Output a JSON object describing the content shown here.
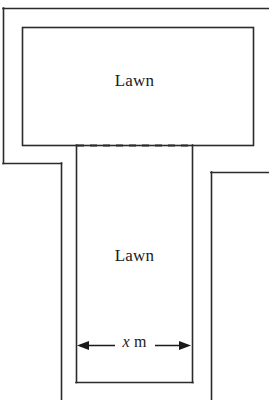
{
  "figure": {
    "background_color": "#ffffff",
    "line_color": "#2b2b2b",
    "labels": {
      "lawn_top": "Lawn",
      "lawn_bottom": "Lawn",
      "dimension_variable": "x",
      "dimension_unit": "m",
      "dimension_full": "x m"
    },
    "geometry": {
      "width": 269,
      "height": 400,
      "outer_boundary": {
        "top_edge_y": 8,
        "left_edge_x": 3,
        "left_edge_bottom_y": 163,
        "left_step_x": 61,
        "right_edge_x": 211,
        "right_step_y": 172
      },
      "top_lawn_rect": {
        "x": 22,
        "y": 27,
        "width": 231,
        "height": 118
      },
      "bottom_lawn_strip": {
        "x": 76,
        "y": 145,
        "width": 116,
        "height": 237
      },
      "dashed_divider": {
        "y": 145,
        "x_start": 76,
        "x_end": 192
      },
      "dimension_arrow": {
        "y": 345,
        "x_start": 78,
        "x_end": 190
      }
    }
  }
}
